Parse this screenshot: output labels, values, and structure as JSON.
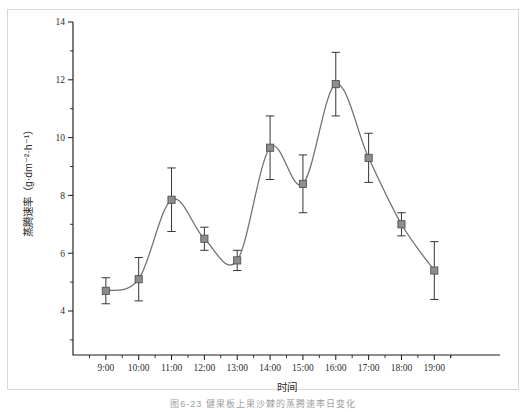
{
  "figure": {
    "caption": "图6-23  健果板上果沙棘的蒸腾速率日变化",
    "frame_color": "#d8d8d8"
  },
  "chart_data": {
    "type": "line",
    "title": "",
    "subtitle": "",
    "xlabel": "时间",
    "ylabel": "蒸腾速率（g·dm⁻²·h⁻¹）",
    "ylabel_text": "蒸腾速率",
    "ylabel_units": "（g·dm⁻²·h⁻¹）",
    "categories": [
      "9:00",
      "10:00",
      "11:00",
      "12:00",
      "13:00",
      "14:00",
      "15:00",
      "16:00",
      "17:00",
      "18:00",
      "19:00"
    ],
    "x_tick_labels": [
      "9:00",
      "10:00",
      "11:00",
      "12:00",
      "13:00",
      "14:00",
      "15:00",
      "16:00",
      "17:00",
      "18:00",
      "19:00"
    ],
    "y_tick_labels": [
      "4",
      "6",
      "8",
      "10",
      "12",
      "14"
    ],
    "y_major_ticks": [
      4,
      6,
      8,
      10,
      12,
      14
    ],
    "y_minor_ticks": [
      3,
      5,
      7,
      9,
      11,
      13
    ],
    "values": [
      4.7,
      5.1,
      7.85,
      6.5,
      5.75,
      9.65,
      8.4,
      11.85,
      9.3,
      7.0,
      5.4
    ],
    "errors": [
      0.45,
      0.75,
      1.1,
      0.4,
      0.35,
      1.1,
      1.0,
      1.1,
      0.85,
      0.4,
      1.0
    ],
    "series": [
      {
        "name": "蒸腾速率",
        "values": [
          4.7,
          5.1,
          7.85,
          6.5,
          5.75,
          9.65,
          8.4,
          11.85,
          9.3,
          7.0,
          5.4
        ],
        "errors": [
          0.45,
          0.75,
          1.1,
          0.4,
          0.35,
          1.1,
          1.0,
          1.1,
          0.85,
          0.4,
          1.0
        ],
        "marker": "filled-square",
        "marker_color": "#8d8d8d",
        "line_color": "#6e6e6e",
        "error_color": "#2a2a2a"
      }
    ],
    "ylim": [
      3,
      14
    ],
    "xlim": [
      0,
      12
    ],
    "grid": false,
    "legend": false,
    "legend_position": "none",
    "smooth": true,
    "spines": [
      "left",
      "bottom"
    ],
    "tick_direction": "out"
  }
}
